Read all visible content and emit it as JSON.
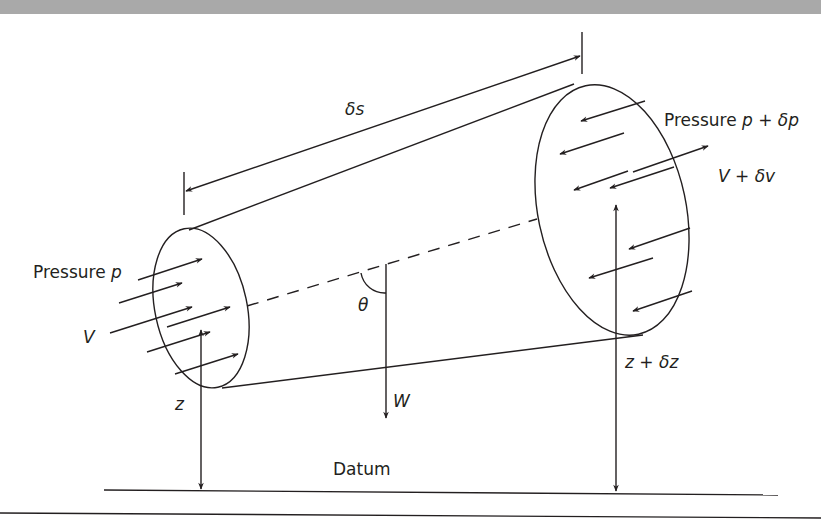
{
  "figure": {
    "colors": {
      "ink": "#231f20",
      "top_band": "#a9a9a9",
      "background": "#ffffff"
    },
    "labels": {
      "length": "δs",
      "pressure_in_prefix": "Pressure ",
      "pressure_in_var": "p",
      "velocity_in": "V",
      "pressure_out_prefix": "Pressure ",
      "pressure_out_var": "p + δp",
      "velocity_out": "V + δv",
      "angle": "θ",
      "weight": "W",
      "height_in": "z",
      "height_out": "z + δz",
      "datum": "Datum"
    }
  }
}
